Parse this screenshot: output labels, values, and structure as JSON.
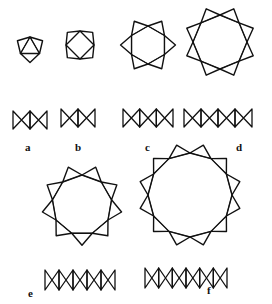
{
  "figure": {
    "panels": [
      {
        "label": "a",
        "ring_size": 3
      },
      {
        "label": "b",
        "ring_size": 4
      },
      {
        "label": "c",
        "ring_size": 6
      },
      {
        "label": "d",
        "ring_size": 8
      },
      {
        "label": "e",
        "ring_size": 9
      },
      {
        "label": "f",
        "ring_size": 12
      }
    ]
  }
}
